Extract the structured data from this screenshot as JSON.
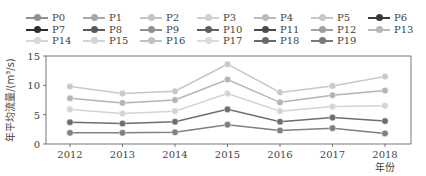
{
  "chart_data": {
    "type": "line",
    "title": "",
    "xlabel": "年份",
    "ylabel": "年平均流量/(m³/s)",
    "x": [
      "2012",
      "2013",
      "2014",
      "2015",
      "2016",
      "2017",
      "2018"
    ],
    "ylim": [
      0,
      15
    ],
    "yticks": [
      0,
      5,
      10,
      15
    ],
    "grid": false,
    "legend_position": "top",
    "legend_entries": [
      "P0",
      "P1",
      "P2",
      "P3",
      "P4",
      "P5",
      "P6",
      "P7",
      "P8",
      "P9",
      "P10",
      "P11",
      "P12",
      "P13",
      "P14",
      "P15",
      "P16",
      "P17",
      "P18",
      "P19"
    ],
    "series": [
      {
        "name": "upper",
        "color": "#c8c8c8",
        "values": [
          9.8,
          8.6,
          9.0,
          13.6,
          8.8,
          9.9,
          11.5
        ]
      },
      {
        "name": "upper-mid",
        "color": "#b4b4b4",
        "values": [
          7.8,
          7.0,
          7.5,
          11.0,
          7.1,
          8.3,
          9.1
        ]
      },
      {
        "name": "middle",
        "color": "#d4d4d4",
        "values": [
          5.9,
          5.2,
          5.6,
          8.6,
          5.6,
          6.4,
          6.5
        ]
      },
      {
        "name": "lower-mid",
        "color": "#6e6e6e",
        "values": [
          3.7,
          3.5,
          3.8,
          5.9,
          3.8,
          4.5,
          3.9
        ]
      },
      {
        "name": "lower",
        "color": "#808080",
        "values": [
          1.9,
          1.9,
          2.0,
          3.3,
          2.3,
          2.7,
          1.8
        ]
      }
    ]
  },
  "legend": [
    {
      "label": "P0",
      "color": "#909090"
    },
    {
      "label": "P1",
      "color": "#a8a8a8"
    },
    {
      "label": "P2",
      "color": "#c4c4c4"
    },
    {
      "label": "P3",
      "color": "#d0d0d0"
    },
    {
      "label": "P4",
      "color": "#bcbcbc"
    },
    {
      "label": "P5",
      "color": "#c8c8c8"
    },
    {
      "label": "P6",
      "color": "#3a3a3a"
    },
    {
      "label": "P7",
      "color": "#2e2e2e"
    },
    {
      "label": "P8",
      "color": "#5a5a5a"
    },
    {
      "label": "P9",
      "color": "#909090"
    },
    {
      "label": "P10",
      "color": "#606060"
    },
    {
      "label": "P11",
      "color": "#4a4a4a"
    },
    {
      "label": "P12",
      "color": "#a0a0a0"
    },
    {
      "label": "P13",
      "color": "#b8b8b8"
    },
    {
      "label": "P14",
      "color": "#d8d8d8"
    },
    {
      "label": "P15",
      "color": "#d4d4d4"
    },
    {
      "label": "P16",
      "color": "#c0c0c0"
    },
    {
      "label": "P17",
      "color": "#dcdcdc"
    },
    {
      "label": "P18",
      "color": "#6a6a6a"
    },
    {
      "label": "P19",
      "color": "#7a7a7a"
    }
  ]
}
